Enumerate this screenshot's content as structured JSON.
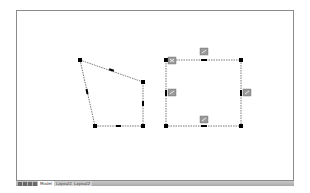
{
  "layout_tabs": {
    "nav_buttons": [
      "first",
      "previous",
      "next",
      "last"
    ],
    "tabs": [
      {
        "label": "Model",
        "active": true
      },
      {
        "label": "Layout1",
        "active": false
      },
      {
        "label": "Layout2",
        "active": false
      }
    ]
  },
  "drawing": {
    "quadrilateral": {
      "vertices": [
        [
          80,
          60
        ],
        [
          143,
          82
        ],
        [
          143,
          126
        ],
        [
          95,
          126
        ]
      ],
      "grip_color": "#000000",
      "line_color": "#555555"
    },
    "rectangle": {
      "vertices": [
        [
          166,
          60
        ],
        [
          241,
          60
        ],
        [
          241,
          126
        ],
        [
          166,
          126
        ]
      ],
      "grip_color": "#000000",
      "line_color": "#555555",
      "dim_badges": [
        {
          "x": 204,
          "y": 51
        },
        {
          "x": 172,
          "y": 60
        },
        {
          "x": 172,
          "y": 92
        },
        {
          "x": 247,
          "y": 92
        },
        {
          "x": 204,
          "y": 119
        }
      ],
      "badge_color": "#9a9a9a"
    }
  }
}
